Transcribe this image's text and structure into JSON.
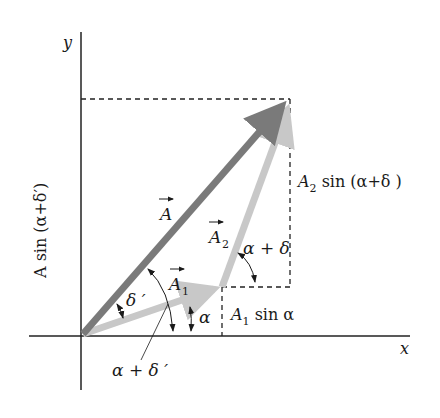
{
  "diagram": {
    "axes": {
      "x_label": "x",
      "y_label": "y"
    },
    "vectors": [
      {
        "name": "A",
        "label": "A",
        "color": "#7a7a7a",
        "from": "origin",
        "to": "tip_A"
      },
      {
        "name": "A1",
        "label": "A",
        "subscript": "1",
        "color": "#c8c8c8",
        "from": "origin",
        "to": "tip_A1"
      },
      {
        "name": "A2",
        "label": "A",
        "subscript": "2",
        "color": "#c8c8c8",
        "from": "tip_A1",
        "to": "tip_A"
      }
    ],
    "angles": {
      "alpha": "α",
      "delta_prime": "δ ′",
      "alpha_plus_delta_prime": "α + δ ′",
      "alpha_plus_delta": "α + δ"
    },
    "projections": {
      "resultant_y": "A sin (α+δ′)",
      "a2_y_prefix": "A",
      "a2_y_sub": "2",
      "a2_y_rest": " sin (α+δ )",
      "a1_y_prefix": "A",
      "a1_y_sub": "1",
      "a1_y_rest": " sin α"
    },
    "colors": {
      "axis": "#222222",
      "resultant": "#7a7a7a",
      "component": "#c8c8c8",
      "dashed": "#222222"
    }
  }
}
